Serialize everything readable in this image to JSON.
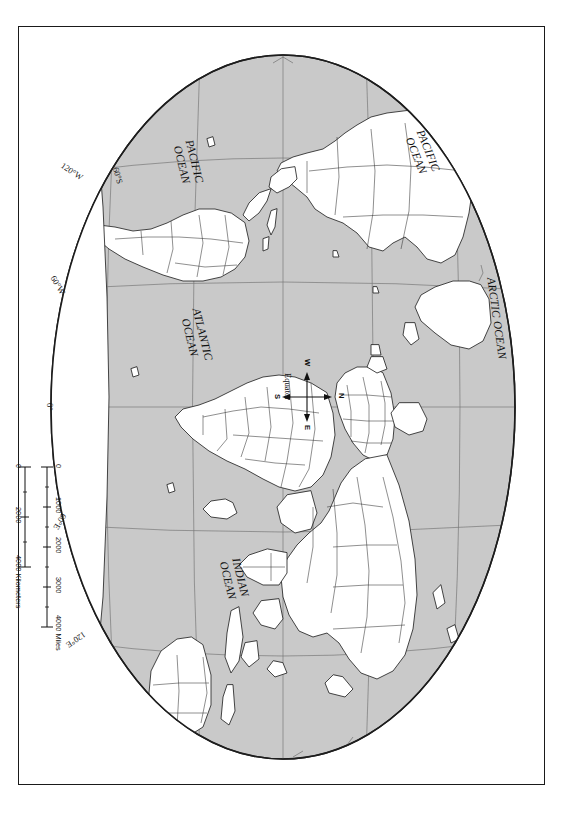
{
  "document": {
    "kind": "world-map-figure",
    "orientation_note": "90",
    "projection": "Robinson",
    "land_fill": "#ffffff",
    "ocean_fill": "#c9c9c9",
    "border_color": "#1a1a1a",
    "graticule_color": "#6b6b6b",
    "coast_color": "#2a2a2a"
  },
  "ocean_labels": [
    {
      "id": "pacific-north",
      "line1": "PACIFIC",
      "line2": "OCEAN"
    },
    {
      "id": "arctic",
      "line1": "ARCTIC OCEAN",
      "line2": ""
    },
    {
      "id": "indian",
      "line1": "INDIAN",
      "line2": "OCEAN"
    },
    {
      "id": "atlantic",
      "line1": "ATLANTIC",
      "line2": "OCEAN"
    },
    {
      "id": "pacific-south",
      "line1": "PACIFIC",
      "line2": "OCEAN"
    }
  ],
  "graticule_labels": [
    {
      "id": "lon-120w",
      "text": "120°W"
    },
    {
      "id": "lon-60w",
      "text": "60°W"
    },
    {
      "id": "lon-0",
      "text": "0°"
    },
    {
      "id": "lon-60e",
      "text": "60°E"
    },
    {
      "id": "lon-120e",
      "text": "120°E"
    },
    {
      "id": "lat-equator",
      "text": "Equator"
    },
    {
      "id": "lat-60s",
      "text": "60°S"
    }
  ],
  "compass": {
    "north": "N",
    "south": "S",
    "east": "E",
    "west": "W"
  },
  "scale_bars": [
    {
      "id": "miles",
      "unit_label": "4000 Miles",
      "ticks": [
        "0",
        "1000",
        "2000",
        "3000",
        "4000"
      ]
    },
    {
      "id": "kilometers",
      "unit_label": "4000 Kilometers",
      "ticks": [
        "0",
        "2000",
        "4000"
      ]
    }
  ]
}
